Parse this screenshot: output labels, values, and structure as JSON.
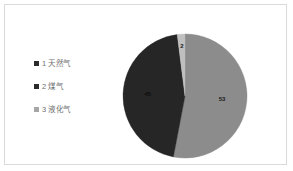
{
  "frame": {
    "border_color": "#d9d9d9",
    "background": "#ffffff"
  },
  "legend": {
    "position": "left",
    "items": [
      {
        "marker": "square-swatch",
        "label": "1 天然气",
        "color": "#2b2b2b"
      },
      {
        "marker": "square-swatch",
        "label": "2 煤气",
        "color": "#2b2b2b"
      },
      {
        "marker": "square-swatch",
        "label": "3 液化气",
        "color": "#a6a6a6"
      }
    ]
  },
  "chart_data": {
    "type": "pie",
    "title": "",
    "labels": [
      "1 天然气",
      "2 煤气",
      "3 液化气"
    ],
    "values": [
      53,
      45,
      2
    ],
    "colors": [
      "#8c8c8c",
      "#262626",
      "#bfbfbf"
    ],
    "data_labels": [
      "53",
      "45",
      "2"
    ],
    "data_label_colors": [
      "#1a1a1a",
      "#0d0d0d",
      "#1a1a1a"
    ],
    "start_angle_deg": 0,
    "direction": "clockwise",
    "total": 100,
    "legend_position": "left",
    "grid": false,
    "show_data_labels": true,
    "label_radius_fraction": 0.6
  }
}
